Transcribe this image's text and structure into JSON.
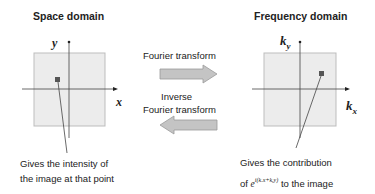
{
  "left_panel": {
    "title": "Space domain",
    "axis_x_label": "x",
    "axis_y_label": "y",
    "caption_line1": "Gives the intensity of",
    "caption_line2": "the image at that point"
  },
  "middle": {
    "forward_label": "Fourier transform",
    "inverse_label_line1": "Inverse",
    "inverse_label_line2": "Fourier transform"
  },
  "right_panel": {
    "title": "Frequency domain",
    "axis_x_label_base": "k",
    "axis_x_label_sub": "x",
    "axis_y_label_base": "k",
    "axis_y_label_sub": "y",
    "caption_line1": "Gives the contribution",
    "caption_line2_prefix": "of",
    "caption_exp_base": "e",
    "caption_exp_sup": "i(kₓx+kᵧy)",
    "caption_line2_suffix": "to the image"
  },
  "colors": {
    "panel_fill": "#ececec",
    "panel_border": "#bdbdbd",
    "marker": "#555555",
    "arrow_fill": "#c4c4c4",
    "arrow_stroke": "#9a9a9a"
  }
}
